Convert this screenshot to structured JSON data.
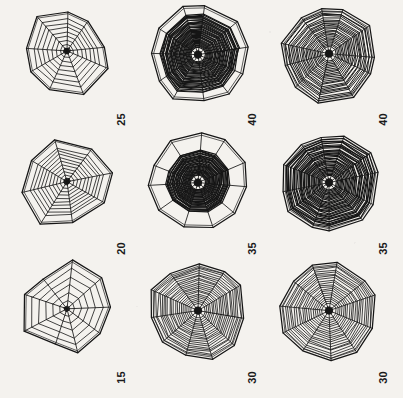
{
  "figure": {
    "type": "image-grid",
    "rows": 3,
    "columns": 3,
    "background_color": "#f4f2ee",
    "ink_color": "#151515",
    "orientation": "labels rotated 90 degrees counter-clockwise"
  },
  "panels": [
    {
      "id": "panel-r1c1",
      "label": "25",
      "row": 1,
      "col": 1,
      "subject": "spider-web",
      "radii": 9,
      "spiral_turns": 7,
      "frame_sides": 5,
      "density": "sparse",
      "shape": "irregular quadrilateral frame, web offset to upper right",
      "center": [
        72,
        46
      ],
      "size": [
        118,
        104
      ]
    },
    {
      "id": "panel-r1c2",
      "label": "40",
      "row": 1,
      "col": 2,
      "subject": "spider-web",
      "radii": 11,
      "spiral_turns": 34,
      "frame_sides": 11,
      "density": "very-dense",
      "shape": "hendecagonal frame with near-solid dark capture spiral",
      "center": [
        200,
        56
      ],
      "size": [
        116,
        112
      ]
    },
    {
      "id": "panel-r1c3",
      "label": "40",
      "row": 1,
      "col": 3,
      "subject": "spider-web",
      "radii": 11,
      "spiral_turns": 24,
      "frame_sides": 11,
      "density": "dense",
      "shape": "regular hendecagonal web, evenly spaced spiral",
      "center": [
        330,
        55
      ],
      "size": [
        114,
        110
      ]
    },
    {
      "id": "panel-r2c1",
      "label": "20",
      "row": 2,
      "col": 1,
      "subject": "spider-web",
      "radii": 8,
      "spiral_turns": 9,
      "frame_sides": 6,
      "density": "sparse",
      "shape": "hexagonal frame, wide outer free zone",
      "center": [
        70,
        183
      ],
      "size": [
        118,
        110
      ]
    },
    {
      "id": "panel-r2c2",
      "label": "35",
      "row": 2,
      "col": 2,
      "subject": "spider-web",
      "radii": 11,
      "spiral_turns": 30,
      "frame_sides": 11,
      "density": "very-dense",
      "shape": "hendecagonal frame, dark disc of spiral inside large free zone",
      "center": [
        199,
        186
      ],
      "size": [
        116,
        112
      ]
    },
    {
      "id": "panel-r2c3",
      "label": "35",
      "row": 2,
      "col": 3,
      "subject": "spider-web",
      "radii": 12,
      "spiral_turns": 30,
      "frame_sides": 12,
      "density": "very-dense",
      "shape": "dodecagonal web filled to the frame edge",
      "center": [
        329,
        187
      ],
      "size": [
        114,
        112
      ]
    },
    {
      "id": "panel-r3c1",
      "label": "15",
      "row": 3,
      "col": 1,
      "subject": "spider-web",
      "radii": 9,
      "spiral_turns": 5,
      "frame_sides": 8,
      "density": "very-sparse",
      "shape": "octagonal frame, only a few inner spiral turns",
      "center": [
        70,
        313
      ],
      "size": [
        118,
        108
      ]
    },
    {
      "id": "panel-r3c2",
      "label": "30",
      "row": 3,
      "col": 2,
      "subject": "spider-web",
      "radii": 11,
      "spiral_turns": 20,
      "frame_sides": 11,
      "density": "medium-dense",
      "shape": "hendecagonal web, regular spiral to the frame",
      "center": [
        198,
        315
      ],
      "size": [
        116,
        112
      ]
    },
    {
      "id": "panel-r3c3",
      "label": "30",
      "row": 3,
      "col": 3,
      "subject": "spider-web",
      "radii": 11,
      "spiral_turns": 19,
      "frame_sides": 11,
      "density": "medium-dense",
      "shape": "hendecagonal web with dark tangled hub",
      "center": [
        329,
        315
      ],
      "size": [
        114,
        112
      ]
    }
  ],
  "labels": {
    "r1c1": "25",
    "r1c2": "40",
    "r1c3": "40",
    "r2c1": "20",
    "r2c2": "35",
    "r2c3": "35",
    "r3c1": "15",
    "r3c2": "30",
    "r3c3": "30"
  }
}
